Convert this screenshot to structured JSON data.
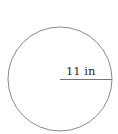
{
  "diagram": {
    "shape": "circle",
    "circle": {
      "cx": 60,
      "cy": 79,
      "r": 52,
      "stroke": "#8a8a8a",
      "fill": "#ffffff"
    },
    "radius_line": {
      "x1": 60,
      "y1": 79.5,
      "x2": 112,
      "y2": 79.5,
      "stroke": "#777777"
    },
    "label": {
      "text": "11 in",
      "x": 66,
      "y": 75
    }
  }
}
